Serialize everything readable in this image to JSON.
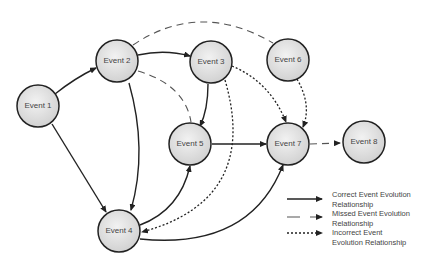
{
  "diagram": {
    "nodes": [
      {
        "id": "e1",
        "label": "Event 1",
        "x": 38,
        "y": 106
      },
      {
        "id": "e2",
        "label": "Event 2",
        "x": 117,
        "y": 61
      },
      {
        "id": "e3",
        "label": "Event 3",
        "x": 211,
        "y": 62
      },
      {
        "id": "e4",
        "label": "Event 4",
        "x": 119,
        "y": 231
      },
      {
        "id": "e5",
        "label": "Event 5",
        "x": 190,
        "y": 144
      },
      {
        "id": "e6",
        "label": "Event 6",
        "x": 288,
        "y": 60
      },
      {
        "id": "e7",
        "label": "Event 7",
        "x": 288,
        "y": 144
      },
      {
        "id": "e8",
        "label": "Event 8",
        "x": 364,
        "y": 142
      }
    ],
    "edges": [
      {
        "from": "Event 1",
        "to": "Event 2",
        "type": "correct"
      },
      {
        "from": "Event 1",
        "to": "Event 4",
        "type": "correct"
      },
      {
        "from": "Event 2",
        "to": "Event 3",
        "type": "correct"
      },
      {
        "from": "Event 2",
        "to": "Event 4",
        "type": "correct"
      },
      {
        "from": "Event 3",
        "to": "Event 5",
        "type": "correct"
      },
      {
        "from": "Event 4",
        "to": "Event 5",
        "type": "correct"
      },
      {
        "from": "Event 5",
        "to": "Event 7",
        "type": "correct"
      },
      {
        "from": "Event 4",
        "to": "Event 7",
        "type": "correct"
      },
      {
        "from": "Event 2",
        "to": "Event 6",
        "type": "missed"
      },
      {
        "from": "Event 2",
        "to": "Event 5",
        "type": "missed"
      },
      {
        "from": "Event 7",
        "to": "Event 8",
        "type": "missed"
      },
      {
        "from": "Event 3",
        "to": "Event 7",
        "type": "incorrect"
      },
      {
        "from": "Event 6",
        "to": "Event 7",
        "type": "incorrect"
      },
      {
        "from": "Event 3",
        "to": "Event 4",
        "type": "incorrect"
      }
    ]
  },
  "legend": {
    "correct": "Correct Event Evolution Relationship",
    "correct_l1": "Correct Event Evolution",
    "correct_l2": "Relationship",
    "missed_l1": "Missed Event Evolution",
    "missed_l2": "Relationship",
    "incorrect_l1": "Incorrect Event",
    "incorrect_l2": "Evolution Relationship"
  }
}
